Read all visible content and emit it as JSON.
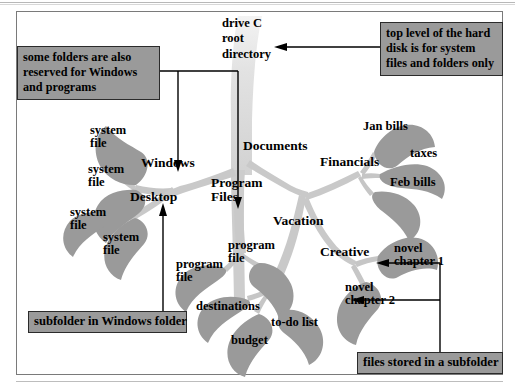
{
  "figure": {
    "type": "tree-diagram",
    "background_color": "#ffffff",
    "trunk_color": "#dedede",
    "branch_color": "#c8c8c8",
    "leaf_color": "#9a9a9a",
    "callout_fill": "#9a9a9a",
    "callout_border": "#2b2b2b",
    "text_color": "#000000"
  },
  "root": {
    "label": "drive C\nroot\ndirectory"
  },
  "nodes": [
    {
      "id": "windows",
      "label": "Windows"
    },
    {
      "id": "desktop",
      "label": "Desktop"
    },
    {
      "id": "program-files",
      "label": "Program\nFiles"
    },
    {
      "id": "documents",
      "label": "Documents"
    },
    {
      "id": "financials",
      "label": "Financials"
    },
    {
      "id": "vacation",
      "label": "Vacation"
    },
    {
      "id": "creative",
      "label": "Creative"
    }
  ],
  "leaves": [
    {
      "id": "system-file-1",
      "label": "system\nfile",
      "parent": "windows"
    },
    {
      "id": "system-file-2",
      "label": "system\nfile",
      "parent": "windows"
    },
    {
      "id": "system-file-3",
      "label": "system\nfile",
      "parent": "desktop"
    },
    {
      "id": "system-file-4",
      "label": "system\nfile",
      "parent": "desktop"
    },
    {
      "id": "program-file-1",
      "label": "program\nfile",
      "parent": "program-files"
    },
    {
      "id": "program-file-2",
      "label": "program\nfile",
      "parent": "program-files"
    },
    {
      "id": "jan-bills",
      "label": "Jan bills",
      "parent": "financials"
    },
    {
      "id": "taxes",
      "label": "taxes",
      "parent": "financials"
    },
    {
      "id": "feb-bills",
      "label": "Feb bills",
      "parent": "financials"
    },
    {
      "id": "destinations",
      "label": "destinations",
      "parent": "vacation"
    },
    {
      "id": "budget",
      "label": "budget",
      "parent": "vacation"
    },
    {
      "id": "to-do-list",
      "label": "to-do list",
      "parent": "vacation"
    },
    {
      "id": "novel-chapter-1",
      "label": "novel\nchapter 1",
      "parent": "creative"
    },
    {
      "id": "novel-chapter-2",
      "label": "novel\nchapter 2",
      "parent": "creative"
    }
  ],
  "callouts": [
    {
      "id": "callout-windows-reserved",
      "text": "some folders are also\nreserved for Windows\nand programs",
      "points_to": [
        "Windows",
        "Program Files"
      ]
    },
    {
      "id": "callout-top-level",
      "text": "top level of the hard\ndisk is for system\nfiles and folders only",
      "points_to": [
        "drive C root directory"
      ]
    },
    {
      "id": "callout-subfolder",
      "text": "subfolder in Windows folder",
      "points_to": [
        "Desktop"
      ]
    },
    {
      "id": "callout-files-subfolder",
      "text": "files stored in a subfolder",
      "points_to": [
        "novel chapter 1",
        "novel chapter 2"
      ]
    }
  ]
}
